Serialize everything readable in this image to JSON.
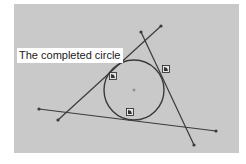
{
  "figure": {
    "label": "The completed circle",
    "colors": {
      "background": "#c9c9c9",
      "stroke": "#3a3a3a",
      "label_bg": "#ffffff"
    },
    "circle": {
      "cx": 134,
      "cy": 90,
      "r": 30
    },
    "lines": [
      {
        "name": "line-upper-left",
        "x1": 58,
        "y1": 120,
        "x2": 161,
        "y2": 26
      },
      {
        "name": "line-right",
        "x1": 141,
        "y1": 32,
        "x2": 194,
        "y2": 145
      },
      {
        "name": "line-bottom",
        "x1": 39,
        "y1": 109,
        "x2": 216,
        "y2": 131
      }
    ],
    "tangent_markers": [
      {
        "x": 113,
        "y": 76
      },
      {
        "x": 166,
        "y": 69
      },
      {
        "x": 130,
        "y": 112
      }
    ],
    "center_marker": {
      "x": 134,
      "y": 90
    }
  }
}
